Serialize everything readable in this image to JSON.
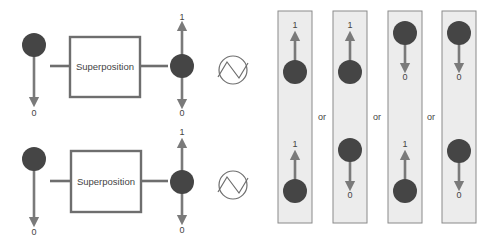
{
  "colors": {
    "qubit_fill": "#454545",
    "arrow": "#7a7a7a",
    "box_stroke": "#6e6e6e",
    "panel_fill": "#ececec",
    "panel_stroke": "#8a8a8a",
    "text": "#444444",
    "wave": "#6e6e6e"
  },
  "rows": [
    {
      "id": "top",
      "input_qubit": {
        "cx": 34,
        "cy": 45,
        "r": 12,
        "arrow": "down",
        "arrow_end": 102,
        "label": "0",
        "label_y": 116
      },
      "gate": {
        "label": "Superposition",
        "x": 70,
        "y": 37,
        "w": 70,
        "h": 60,
        "line_y": 66,
        "line_in_x1": 50,
        "line_out_x2": 168
      },
      "output_qubit": {
        "cx": 182,
        "cy": 66,
        "r": 12,
        "up_end": 26,
        "up_label": "1",
        "up_label_y": 20,
        "down_end": 104,
        "down_label": "0",
        "down_label_y": 116
      },
      "wave_icon": {
        "cx": 233,
        "cy": 70,
        "r": 14
      }
    },
    {
      "id": "bottom",
      "input_qubit": {
        "cx": 34,
        "cy": 159,
        "r": 12,
        "arrow": "down",
        "arrow_end": 222,
        "label": "0",
        "label_y": 235
      },
      "gate": {
        "label": "Superposition",
        "x": 71,
        "y": 151,
        "w": 70,
        "h": 61,
        "line_y": 181,
        "line_in_x1": 50,
        "line_out_x2": 168
      },
      "output_qubit": {
        "cx": 182,
        "cy": 182,
        "r": 12,
        "up_end": 143,
        "up_label": "1",
        "up_label_y": 135,
        "down_end": 220,
        "down_label": "0",
        "down_label_y": 233
      },
      "wave_icon": {
        "cx": 233,
        "cy": 185,
        "r": 14
      }
    }
  ],
  "outcomes": {
    "separator": "or",
    "separator_y": 120,
    "separator_x": [
      322,
      377,
      431
    ],
    "panels": [
      {
        "x": 278,
        "y": 11,
        "w": 34,
        "h": 212,
        "qubits": [
          {
            "cx": 295,
            "cy": 72,
            "dir": "up",
            "end": 36,
            "label": "1",
            "label_y": 28
          },
          {
            "cx": 295,
            "cy": 191,
            "dir": "up",
            "end": 155,
            "label": "1",
            "label_y": 147
          }
        ]
      },
      {
        "x": 333,
        "y": 11,
        "w": 34,
        "h": 212,
        "qubits": [
          {
            "cx": 350,
            "cy": 72,
            "dir": "up",
            "end": 36,
            "label": "1",
            "label_y": 28
          },
          {
            "cx": 350,
            "cy": 150,
            "dir": "down",
            "end": 186,
            "label": "0",
            "label_y": 198
          }
        ]
      },
      {
        "x": 388,
        "y": 11,
        "w": 34,
        "h": 212,
        "qubits": [
          {
            "cx": 405,
            "cy": 33,
            "dir": "down",
            "end": 68,
            "label": "0",
            "label_y": 80
          },
          {
            "cx": 405,
            "cy": 191,
            "dir": "up",
            "end": 155,
            "label": "1",
            "label_y": 147
          }
        ]
      },
      {
        "x": 442,
        "y": 11,
        "w": 34,
        "h": 212,
        "qubits": [
          {
            "cx": 459,
            "cy": 33,
            "dir": "down",
            "end": 68,
            "label": "0",
            "label_y": 80
          },
          {
            "cx": 459,
            "cy": 151,
            "dir": "down",
            "end": 186,
            "label": "0",
            "label_y": 198
          }
        ]
      }
    ]
  }
}
